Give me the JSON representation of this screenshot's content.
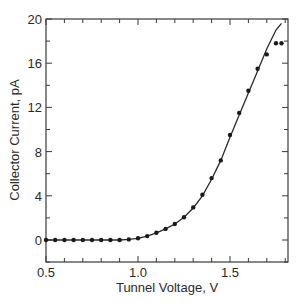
{
  "chart_data": {
    "type": "scatter",
    "title": "",
    "xlabel": "Tunnel Voltage, V",
    "ylabel": "Collector Current, pA",
    "xlim": [
      0.5,
      1.815
    ],
    "ylim": [
      -2,
      20
    ],
    "x_ticks": [
      0.5,
      1.0,
      1.5
    ],
    "x_tick_labels": [
      "0.5",
      "1.0",
      "1.5"
    ],
    "y_ticks": [
      0,
      4,
      8,
      12,
      16,
      20
    ],
    "y_tick_labels": [
      "0",
      "4",
      "8",
      "12",
      "16",
      "20"
    ],
    "grid": false,
    "legend": null,
    "series": [
      {
        "name": "measured",
        "style": "markers",
        "x": [
          0.5,
          0.55,
          0.6,
          0.65,
          0.7,
          0.75,
          0.8,
          0.85,
          0.9,
          0.95,
          1.0,
          1.05,
          1.1,
          1.15,
          1.2,
          1.25,
          1.3,
          1.35,
          1.4,
          1.45,
          1.5,
          1.55,
          1.6,
          1.65,
          1.7,
          1.75,
          1.78
        ],
        "y": [
          0,
          0,
          0,
          0,
          0,
          0,
          0,
          0,
          0,
          0.05,
          0.15,
          0.35,
          0.65,
          1.0,
          1.45,
          2.05,
          2.95,
          4.1,
          5.6,
          7.2,
          9.5,
          11.5,
          13.5,
          15.5,
          16.8,
          17.8,
          17.8
        ]
      },
      {
        "name": "model",
        "style": "line",
        "x": [
          0.5,
          0.9,
          0.95,
          1.0,
          1.05,
          1.1,
          1.15,
          1.2,
          1.25,
          1.3,
          1.35,
          1.4,
          1.45,
          1.5,
          1.55,
          1.6,
          1.65,
          1.7,
          1.75,
          1.78
        ],
        "y": [
          0,
          0,
          0.05,
          0.15,
          0.35,
          0.65,
          1.0,
          1.45,
          2.05,
          2.9,
          4.0,
          5.5,
          7.2,
          9.3,
          11.3,
          13.3,
          15.3,
          17.3,
          19.0,
          19.6
        ]
      }
    ]
  }
}
